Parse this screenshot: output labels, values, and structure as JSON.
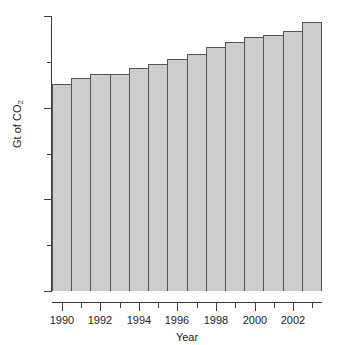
{
  "chart_data": {
    "type": "bar",
    "title": "",
    "xlabel": "Year",
    "ylabel": "Gt of CO2",
    "ylabel_base": "Gt of CO",
    "ylabel_sub": "2",
    "categories": [
      1990,
      1991,
      1992,
      1993,
      1994,
      1995,
      1996,
      1997,
      1998,
      1999,
      2000,
      2001,
      2002,
      2003
    ],
    "values": [
      4.52,
      4.65,
      4.73,
      4.74,
      4.87,
      4.95,
      5.07,
      5.17,
      5.33,
      5.44,
      5.55,
      5.58,
      5.68,
      5.87
    ],
    "ylim": [
      0,
      6
    ],
    "xlim": [
      1989.5,
      2003.5
    ],
    "y_major_ticks": [
      0,
      2,
      4,
      6
    ],
    "y_major_tick_labels": [
      "0",
      "2",
      "4",
      "6"
    ],
    "y_minor_ticks": [
      1,
      3,
      5
    ],
    "x_major_ticks": [
      1990,
      1992,
      1994,
      1996,
      1998,
      2000,
      2002
    ],
    "x_major_tick_labels": [
      "1990",
      "1992",
      "1994",
      "1996",
      "1998",
      "2000",
      "2002"
    ],
    "x_minor_ticks": [
      1991,
      1993,
      1995,
      1997,
      1999,
      2001,
      2003
    ],
    "grid": false,
    "legend": null,
    "bar_fill_color": "#cdcdcd",
    "bar_edge_color": "#545454",
    "axis_color": "#3b3b3b",
    "text_color": "#1c1c1c",
    "background_color": "#ffffff"
  }
}
